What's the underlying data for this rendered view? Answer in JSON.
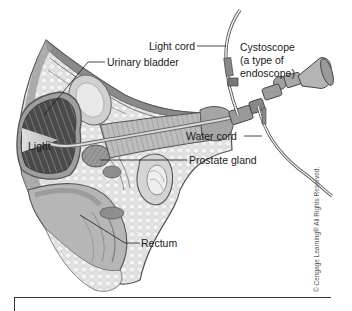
{
  "figure": {
    "labels": {
      "light_cord": "Light cord",
      "cystoscope_line1": "Cystoscope",
      "cystoscope_line2": "(a type of",
      "cystoscope_line3": "endoscope)",
      "urinary_bladder": "Urinary bladder",
      "light": "Light",
      "water_cord": "Water cord",
      "prostate_gland": "Prostate gland",
      "rectum": "Rectum"
    },
    "copyright": "© Cengage Learning® All Rights Reserved.",
    "colors": {
      "background": "#ffffff",
      "tissue_light": "#d9d9d9",
      "tissue_mid": "#a8a8a8",
      "tissue_dark": "#555555",
      "bladder_dark": "#3a3a3a",
      "outline": "#4a4a4a",
      "leader_line": "#1a1a1a"
    }
  }
}
